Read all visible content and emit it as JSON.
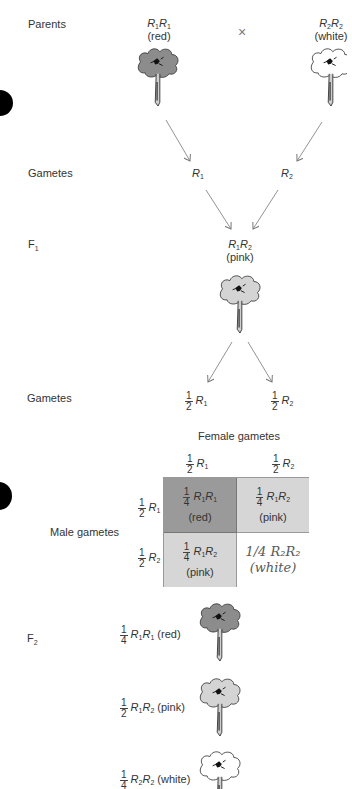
{
  "rows": {
    "parents": "Parents",
    "gametes1": "Gametes",
    "f1": "F",
    "f1_sub": "1",
    "gametes2": "Gametes",
    "f2": "F",
    "f2_sub": "2"
  },
  "parents": {
    "left": {
      "allele_a": "R",
      "sub_a": "1",
      "allele_b": "R",
      "sub_b": "1",
      "phenotype": "(red)"
    },
    "cross_symbol": "×",
    "right": {
      "allele_a": "R",
      "sub_a": "2",
      "allele_b": "R",
      "sub_b": "2",
      "phenotype": "(white)"
    }
  },
  "gametes1": {
    "left": {
      "allele": "R",
      "sub": "1"
    },
    "right": {
      "allele": "R",
      "sub": "2"
    }
  },
  "f1": {
    "allele_a": "R",
    "sub_a": "1",
    "allele_b": "R",
    "sub_b": "2",
    "phenotype": "(pink)"
  },
  "gametes2": {
    "left": {
      "num": "1",
      "den": "2",
      "allele": "R",
      "sub": "1"
    },
    "right": {
      "num": "1",
      "den": "2",
      "allele": "R",
      "sub": "2"
    }
  },
  "punnett": {
    "female_title": "Female gametes",
    "male_title": "Male gametes",
    "female": [
      {
        "num": "1",
        "den": "2",
        "allele": "R",
        "sub": "1"
      },
      {
        "num": "1",
        "den": "2",
        "allele": "R",
        "sub": "2"
      }
    ],
    "male": [
      {
        "num": "1",
        "den": "2",
        "allele": "R",
        "sub": "1"
      },
      {
        "num": "1",
        "den": "2",
        "allele": "R",
        "sub": "2"
      }
    ],
    "cells": [
      {
        "num": "1",
        "den": "4",
        "allele_a": "R",
        "sub_a": "1",
        "allele_b": "R",
        "sub_b": "1",
        "phenotype": "(red)"
      },
      {
        "num": "1",
        "den": "4",
        "allele_a": "R",
        "sub_a": "1",
        "allele_b": "R",
        "sub_b": "2",
        "phenotype": "(pink)"
      },
      {
        "num": "1",
        "den": "4",
        "allele_a": "R",
        "sub_a": "1",
        "allele_b": "R",
        "sub_b": "2",
        "phenotype": "(pink)"
      },
      {
        "handwritten_line1": "1/4 R₂R₂",
        "handwritten_line2": "(white)"
      }
    ]
  },
  "f2": [
    {
      "num": "1",
      "den": "4",
      "allele_a": "R",
      "sub_a": "1",
      "allele_b": "R",
      "sub_b": "1",
      "phenotype": "(red)"
    },
    {
      "num": "1",
      "den": "2",
      "allele_a": "R",
      "sub_a": "1",
      "allele_b": "R",
      "sub_b": "2",
      "phenotype": "(pink)"
    },
    {
      "num": "1",
      "den": "4",
      "allele_a": "R",
      "sub_a": "2",
      "allele_b": "R",
      "sub_b": "2",
      "phenotype": "(white)"
    }
  ],
  "colors": {
    "red_flower": "#8c8c8c",
    "pink_flower": "#d4d4d4",
    "white_flower": "#ffffff",
    "red_cell": "#9a9a9a",
    "pink_cell": "#d6d6d6",
    "arrow": "#777777"
  }
}
